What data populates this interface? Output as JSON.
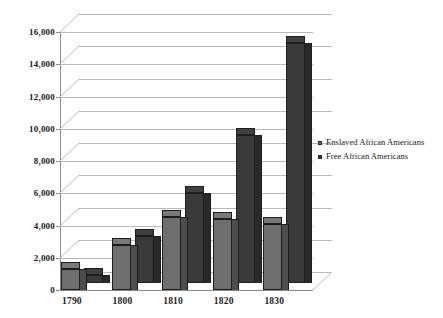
{
  "chart_data": {
    "type": "bar",
    "title": "",
    "subtitle": "",
    "xlabel": "",
    "ylabel": "",
    "categories": [
      "1790",
      "1800",
      "1810",
      "1820",
      "1830"
    ],
    "series": [
      {
        "name": "Enslaved African Americans",
        "color": "#6e6e6e",
        "values": [
          1300,
          2800,
          4500,
          4400,
          4100
        ]
      },
      {
        "name": "Free African Americans",
        "color": "#3a3a3a",
        "values": [
          500,
          2900,
          5600,
          9200,
          14900
        ]
      }
    ],
    "ylim": [
      0,
      16000
    ],
    "ytick_step": 2000,
    "ytick_labels": [
      "0",
      "2,000",
      "4,000",
      "6,000",
      "8,000",
      "10,000",
      "12,000",
      "14,000",
      "16,000"
    ],
    "grid": true,
    "legend_position": "right",
    "style": "3d-column",
    "annotations": []
  },
  "legend": {
    "entries": [
      {
        "label": "Enslaved African Americans",
        "marker": "square-swatch-gray"
      },
      {
        "label": "Free African Americans",
        "marker": "square-swatch-dark"
      }
    ]
  },
  "colors": {
    "series_enslaved": "#6e6e6e",
    "series_free": "#3a3a3a",
    "gridline": "#b9b9b9",
    "axis": "#8a8a8a",
    "text": "#1a1a1a",
    "background": "#ffffff"
  }
}
